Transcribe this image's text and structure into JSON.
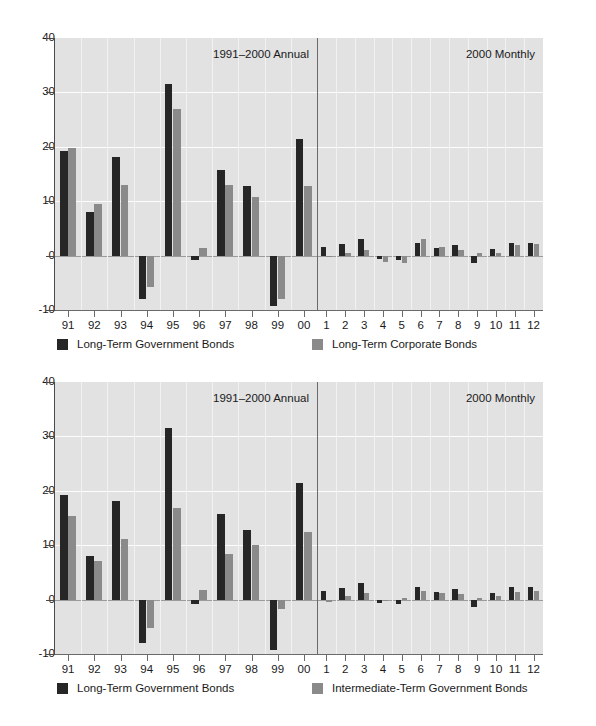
{
  "charts": [
    {
      "name": "chart-government-vs-corporate",
      "annual_title": "1991–2000 Annual",
      "monthly_title": "2000 Monthly",
      "legend": [
        {
          "label": "Long-Term Government Bonds",
          "color": "#262626",
          "swatch": "series-1-swatch"
        },
        {
          "label": "Long-Term Corporate Bonds",
          "color": "#8a8a8a",
          "swatch": "series-2-swatch"
        }
      ]
    },
    {
      "name": "chart-government-vs-intermediate",
      "annual_title": "1991–2000 Annual",
      "monthly_title": "2000 Monthly",
      "legend": [
        {
          "label": "Long-Term Government Bonds",
          "color": "#262626",
          "swatch": "series-1-swatch"
        },
        {
          "label": "Intermediate-Term Government Bonds",
          "color": "#8a8a8a",
          "swatch": "series-2-swatch"
        }
      ]
    }
  ],
  "axis": {
    "y_ticks": [
      "40",
      "30",
      "20",
      "10",
      "0",
      "-10"
    ],
    "y_values": [
      40,
      30,
      20,
      10,
      0,
      -10
    ],
    "ylim": [
      -10,
      40
    ],
    "annual_ticks": [
      "91",
      "92",
      "93",
      "94",
      "95",
      "96",
      "97",
      "98",
      "99",
      "00"
    ],
    "monthly_ticks": [
      "1",
      "2",
      "3",
      "4",
      "5",
      "6",
      "7",
      "8",
      "9",
      "10",
      "11",
      "12"
    ]
  },
  "chart_data": [
    {
      "type": "bar",
      "title": "Long-Term Government Bonds vs Long-Term Corporate Bonds",
      "xlabel": "",
      "ylabel": "",
      "ylim": [
        -10,
        40
      ],
      "grid": true,
      "legend_position": "bottom",
      "panels": [
        {
          "name": "1991-2000 Annual",
          "categories": [
            "91",
            "92",
            "93",
            "94",
            "95",
            "96",
            "97",
            "98",
            "99",
            "00"
          ],
          "series": [
            {
              "name": "Long-Term Government Bonds",
              "color": "#262626",
              "values": [
                19.3,
                8.0,
                18.2,
                -8.0,
                31.6,
                -0.9,
                15.7,
                12.8,
                -9.2,
                21.4
              ]
            },
            {
              "name": "Long-Term Corporate Bonds",
              "color": "#8a8a8a",
              "values": [
                19.7,
                9.4,
                13.0,
                -5.8,
                27.0,
                1.4,
                12.9,
                10.7,
                -7.9,
                12.8
              ]
            }
          ]
        },
        {
          "name": "2000 Monthly",
          "categories": [
            "1",
            "2",
            "3",
            "4",
            "5",
            "6",
            "7",
            "8",
            "9",
            "10",
            "11",
            "12"
          ],
          "series": [
            {
              "name": "Long-Term Government Bonds",
              "color": "#262626",
              "values": [
                1.6,
                2.2,
                3.1,
                -0.7,
                -0.9,
                2.3,
                1.4,
                2.0,
                -1.4,
                1.3,
                2.4,
                2.3
              ]
            },
            {
              "name": "Long-Term Corporate Bonds",
              "color": "#8a8a8a",
              "values": [
                -0.3,
                0.5,
                1.1,
                -1.1,
                -1.4,
                3.0,
                1.5,
                1.1,
                0.5,
                0.4,
                1.9,
                2.2
              ]
            }
          ]
        }
      ]
    },
    {
      "type": "bar",
      "title": "Long-Term Government Bonds vs Intermediate-Term Government Bonds",
      "xlabel": "",
      "ylabel": "",
      "ylim": [
        -10,
        40
      ],
      "grid": true,
      "legend_position": "bottom",
      "panels": [
        {
          "name": "1991-2000 Annual",
          "categories": [
            "91",
            "92",
            "93",
            "94",
            "95",
            "96",
            "97",
            "98",
            "99",
            "00"
          ],
          "series": [
            {
              "name": "Long-Term Government Bonds",
              "color": "#262626",
              "values": [
                19.3,
                8.0,
                18.2,
                -8.0,
                31.6,
                -0.9,
                15.7,
                12.8,
                -9.2,
                21.4
              ]
            },
            {
              "name": "Intermediate-Term Government Bonds",
              "color": "#8a8a8a",
              "values": [
                15.4,
                7.1,
                11.2,
                -5.2,
                16.8,
                1.7,
                8.4,
                10.1,
                -1.8,
                12.4
              ]
            }
          ]
        },
        {
          "name": "2000 Monthly",
          "categories": [
            "1",
            "2",
            "3",
            "4",
            "5",
            "6",
            "7",
            "8",
            "9",
            "10",
            "11",
            "12"
          ],
          "series": [
            {
              "name": "Long-Term Government Bonds",
              "color": "#262626",
              "values": [
                1.6,
                2.2,
                3.1,
                -0.7,
                -0.9,
                2.3,
                1.4,
                2.0,
                -1.4,
                1.3,
                2.4,
                2.3
              ]
            },
            {
              "name": "Intermediate-Term Government Bonds",
              "color": "#8a8a8a",
              "values": [
                -0.4,
                0.6,
                1.3,
                -0.2,
                0.3,
                1.5,
                1.2,
                1.0,
                0.3,
                0.7,
                1.4,
                1.5
              ]
            }
          ]
        }
      ]
    }
  ],
  "colors": {
    "series_1": "#262626",
    "series_2": "#8a8a8a",
    "plot_background": "#e2e2e2",
    "gridline": "#fdfdfd",
    "axis": "#4a4a4a"
  }
}
